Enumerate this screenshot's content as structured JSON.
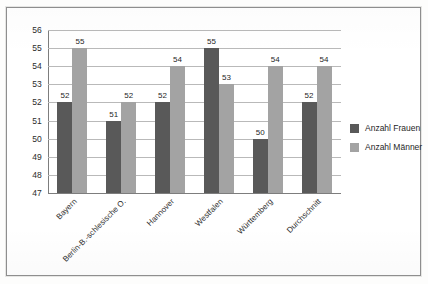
{
  "chart_data": {
    "type": "bar",
    "title": "",
    "subtitle": "",
    "xlabel": "",
    "ylabel": "",
    "ylim": [
      47,
      56
    ],
    "yticks": [
      56,
      55,
      54,
      53,
      52,
      51,
      50,
      49,
      48,
      47
    ],
    "grid": true,
    "legend_position": "right",
    "categories": [
      "Bayern",
      "Berlin-B.-schlesische O.",
      "Hannover",
      "Westfalen",
      "Württemberg",
      "Durchschnitt"
    ],
    "series": [
      {
        "name": "Anzahl Frauen",
        "color": "#595959",
        "values": [
          52,
          51,
          52,
          55,
          50,
          52
        ]
      },
      {
        "name": "Anzahl Männer",
        "color": "#a3a3a3",
        "values": [
          55,
          52,
          54,
          53,
          54,
          54
        ]
      }
    ]
  },
  "legend": {
    "items": [
      {
        "label": "Anzahl Frauen",
        "color": "#595959"
      },
      {
        "label": "Anzahl Männer",
        "color": "#a3a3a3"
      }
    ]
  },
  "colors": {
    "frauen": "#595959",
    "maenner": "#a3a3a3",
    "grid": "#b9b9b9",
    "axis": "#7d7d7d",
    "frame": "#8e8e8e",
    "text": "#1f1f1f",
    "background": "#ffffff"
  }
}
